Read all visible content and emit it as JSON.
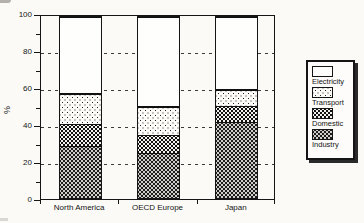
{
  "chart_data": {
    "type": "bar",
    "stacked": true,
    "percent_stacked": true,
    "title": "",
    "categories": [
      "North America",
      "OECD Europe",
      "Japan"
    ],
    "series": [
      {
        "name": "Industry",
        "pattern": "dark-dots",
        "values": [
          29,
          25,
          42
        ]
      },
      {
        "name": "Domestic",
        "pattern": "medium-dots",
        "values": [
          12,
          10,
          9
        ]
      },
      {
        "name": "Transport",
        "pattern": "light-dots",
        "values": [
          17,
          16,
          9
        ]
      },
      {
        "name": "Electricity",
        "pattern": "white",
        "values": [
          42,
          49,
          40
        ]
      }
    ],
    "xlabel": "",
    "ylabel": "%",
    "ylim": [
      0,
      100
    ],
    "yticks": [
      0,
      20,
      40,
      60,
      80,
      100
    ],
    "yticks_minor": [
      10,
      30,
      50,
      70,
      90
    ],
    "gridlines": [
      20,
      40,
      60,
      80
    ],
    "grid_style": "dashed",
    "legend_position": "right",
    "legend_order_top_to_bottom": [
      "Electricity",
      "Transport",
      "Domestic",
      "Industry"
    ]
  },
  "legend": {
    "items": [
      {
        "label": "Electricity",
        "pattern": "white"
      },
      {
        "label": "Transport",
        "pattern": "light-dots"
      },
      {
        "label": "Domestic",
        "pattern": "medium-dots"
      },
      {
        "label": "Industry",
        "pattern": "dark-dots"
      }
    ]
  },
  "colors": {
    "ink": "#151515",
    "paper": "#fbfaf7",
    "electricity_fill": "#fefefc"
  }
}
